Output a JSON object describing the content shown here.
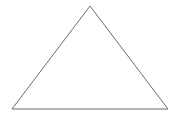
{
  "diagram": {
    "shape": "triangle",
    "vertices": [
      [
        90,
        6
      ],
      [
        12,
        109
      ],
      [
        168,
        109
      ]
    ],
    "stroke_color": "#6b6b6b",
    "fill_color": "none",
    "stroke_width": 1
  }
}
